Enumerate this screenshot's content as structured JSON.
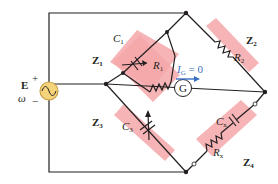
{
  "diagram": {
    "source": {
      "label": "E",
      "freq_label": "ω",
      "plus": "+",
      "minus": "−",
      "color": "#f5d37a"
    },
    "galvanometer": {
      "label": "G"
    },
    "current": {
      "text_main": "I",
      "text_sub": "G",
      "text_rest": " = 0",
      "color": "#3a6fc4"
    },
    "arms": [
      {
        "id": "Z1",
        "label_main": "Z",
        "label_sub": "1",
        "components": [
          {
            "main": "C",
            "sub": "1"
          },
          {
            "main": "R",
            "sub": "1"
          }
        ]
      },
      {
        "id": "Z2",
        "label_main": "Z",
        "label_sub": "2",
        "components": [
          {
            "main": "R",
            "sub": "2"
          }
        ]
      },
      {
        "id": "Z3",
        "label_main": "Z",
        "label_sub": "3",
        "components": [
          {
            "main": "C",
            "sub": "3"
          }
        ]
      },
      {
        "id": "Z4",
        "label_main": "Z",
        "label_sub": "4",
        "components": [
          {
            "main": "C",
            "sub": "x"
          },
          {
            "main": "R",
            "sub": "x"
          }
        ]
      }
    ],
    "colors": {
      "arm_fill": "#f4a7a9",
      "wire": "#231f20"
    }
  }
}
